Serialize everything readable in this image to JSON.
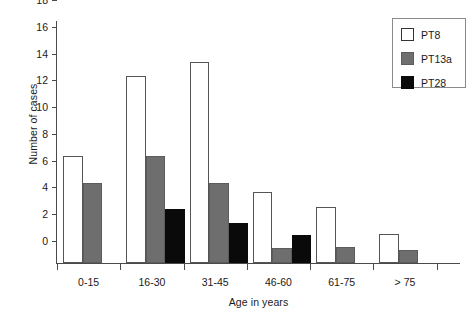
{
  "chart_data": {
    "type": "bar",
    "title": "",
    "xlabel": "Age in years",
    "ylabel": "Number of cases",
    "categories": [
      "0-15",
      "16-30",
      "31-45",
      "46-60",
      "61-75",
      "> 75"
    ],
    "series": [
      {
        "name": "PT8",
        "color": "#ffffff",
        "values": [
          8,
          14,
          15,
          5.3,
          4.2,
          2.2
        ]
      },
      {
        "name": "PT13a",
        "color": "#6e6e6e",
        "values": [
          6,
          8,
          6,
          1.1,
          1.2,
          1.0
        ]
      },
      {
        "name": "PT28",
        "color": "#0a0a0a",
        "values": [
          null,
          4,
          3,
          2.1,
          null,
          null
        ]
      }
    ],
    "ylim": [
      0,
      18
    ],
    "yticks": [
      0,
      2,
      4,
      6,
      8,
      10,
      12,
      14,
      16,
      18
    ],
    "ytick_labels": [
      "0",
      "2",
      "4",
      "6",
      "8",
      "10",
      "12",
      "14",
      "16",
      "18"
    ],
    "grid": false,
    "legend_position": "top-right",
    "legend_entries": [
      "PT8",
      "PT13a",
      "PT28"
    ],
    "axis_color": "#4a4a4a",
    "bar_edge_color": "#555555"
  }
}
